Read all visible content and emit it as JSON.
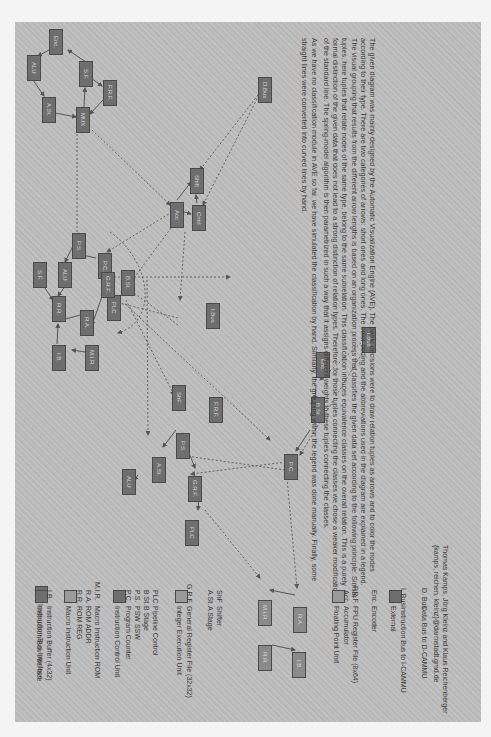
{
  "colors": {
    "page_bg": "#bdbdbd",
    "node_fill": "#6e6e6e",
    "node_border": "#4a4a4a",
    "text": "#3a3a3a",
    "edge": "#555555"
  },
  "description": {
    "paragraphs": [
      "The given diagram was mainly designed by the Automatic Visualization Engine (AVE). The basic decisions were to draw relation tuples as arrows and to color the nodes according to their type. There are two categories of arrows: short ones and long ones. The color coding and the abbreviations used in the diagram are explained in a legend. The visual grouping that results from the different arrow lengths is based on an organization process that classifies the given data set according to the following principle: Similar tuples, here tuples that relate nodes of the same type, belong to the same subrelation. This classification induces equivalence classes on the overall relation. This is a purely formal distinction of the given data that does not lead to a strong distinction of relation types. Therefore, for those tuples connecting the classes we chose a weaker modification of the standard line. The spring-model algorithm is then parametrized in such a way that it assigns different weights to these tuples connecting the classes.",
      "As we have no classification module in AVE so far, we have simulated the classification by hand. Similarly, the grouping within the legend was done manually. Finally, some straight lines were converted into curved lines by hand."
    ]
  },
  "credits": {
    "authors": "Thomas Kamps, Jörg Kleinz and Klaus Reichenberger",
    "emails": "{kamps, reichen, kleinz}@darmstadt.gmd.de"
  },
  "legend": {
    "groups": [
      {
        "swatch": "dark",
        "title": "Instruction Bus Interface",
        "items": [
          {
            "abbr": "I.B.",
            "label": "Instruction Buffer (4x32)"
          }
        ]
      },
      {
        "swatch": "light",
        "title": "Macro Instruction Unit",
        "items": [
          {
            "abbr": "R.R.",
            "label": "ROM REG"
          },
          {
            "abbr": "R.A.",
            "label": "ROM ADDR"
          },
          {
            "abbr": "M.I.R.",
            "label": "Macro Instruction ROM"
          }
        ]
      },
      {
        "swatch": "dark",
        "title": "Instruction Control Unit",
        "items": [
          {
            "abbr": "P.C.",
            "label": "Program Counter"
          },
          {
            "abbr": "P.S.",
            "label": "PSW SSW"
          },
          {
            "abbr": "B.St.",
            "label": "B Stage"
          },
          {
            "abbr": "PLC.",
            "label": "Pipeline Control"
          }
        ]
      },
      {
        "swatch": "light",
        "title": "Integer Execution Unit",
        "items": [
          {
            "abbr": "G.R.F.",
            "label": "General Register File (32x32)"
          },
          {
            "abbr": "A.St.",
            "label": "A Stage"
          },
          {
            "abbr": "ShF",
            "label": "Shifter"
          }
        ]
      },
      {
        "swatch": "light",
        "title": "Floating Point Unit",
        "items": [
          {
            "abbr": "Acc",
            "label": "Accumulator"
          },
          {
            "abbr": "F.R.F.",
            "label": "FPU Register File (8x64)"
          },
          {
            "abbr": "Enc.",
            "label": "Encoder"
          }
        ]
      },
      {
        "swatch": "dark",
        "title": "External",
        "items": [
          {
            "abbr": "I. Bus",
            "label": "Instruction Bus to I-CAMMU"
          },
          {
            "abbr": "D. Bus",
            "label": "Data Bus to D-CAMMU"
          }
        ]
      }
    ]
  },
  "diagram": {
    "nodes": [
      {
        "id": "n1",
        "label": "Enc.",
        "x": 56,
        "y": 29
      },
      {
        "id": "n2",
        "label": "ALU",
        "x": 27,
        "y": 55
      },
      {
        "id": "n3",
        "label": "A.St.",
        "x": 43,
        "y": 97
      },
      {
        "id": "n4",
        "label": "MUX",
        "x": 77,
        "y": 107
      },
      {
        "id": "n5",
        "label": "S.F.",
        "x": 79,
        "y": 61
      },
      {
        "id": "n6",
        "label": "F.R.F.",
        "x": 102,
        "y": 80
      },
      {
        "id": "n7",
        "label": "D.Bus",
        "x": 259,
        "y": 77
      },
      {
        "id": "n8",
        "label": "Acc",
        "x": 170,
        "y": 202
      },
      {
        "id": "n9",
        "label": "Shift",
        "x": 189,
        "y": 168
      },
      {
        "id": "n10",
        "label": "Cntrl",
        "x": 191,
        "y": 205
      },
      {
        "id": "n11",
        "label": "P.S.",
        "x": 72,
        "y": 242
      },
      {
        "id": "n12",
        "label": "ALU",
        "x": 59,
        "y": 262
      },
      {
        "id": "n13",
        "label": "P.C.",
        "x": 98,
        "y": 253
      },
      {
        "id": "n14",
        "label": "B.St.",
        "x": 121,
        "y": 270
      },
      {
        "id": "n15",
        "label": "S.F.",
        "x": 35,
        "y": 272
      },
      {
        "id": "n16",
        "label": "R.R.",
        "x": 52,
        "y": 296
      },
      {
        "id": "n17",
        "label": "PLC",
        "x": 116,
        "y": 283
      },
      {
        "id": "n18",
        "label": "I.B.",
        "x": 55,
        "y": 344
      },
      {
        "id": "n19",
        "label": "R.A.",
        "x": 75,
        "y": 312
      },
      {
        "id": "n20",
        "label": "M.I.R.",
        "x": 84,
        "y": 352
      },
      {
        "id": "n21",
        "label": "G.R.F.",
        "x": 108,
        "y": 279
      },
      {
        "id": "n22",
        "label": "I.Bus",
        "x": 178,
        "y": 300
      },
      {
        "id": "n23",
        "label": "ShF",
        "x": 175,
        "y": 395
      },
      {
        "id": "n24",
        "label": "P.S.",
        "x": 174,
        "y": 407
      },
      {
        "id": "n25",
        "label": "A.St.",
        "x": 153,
        "y": 436
      },
      {
        "id": "n26",
        "label": "ALU",
        "x": 127,
        "y": 460
      },
      {
        "id": "n27",
        "label": "G.R.F.",
        "x": 124,
        "y": 465
      },
      {
        "id": "n28",
        "label": "PLC",
        "x": 190,
        "y": 469
      },
      {
        "id": "n29",
        "label": "F.R.F.",
        "x": 198,
        "y": 511
      },
      {
        "id": "n30",
        "label": "P.C.",
        "x": 286,
        "y": 451
      },
      {
        "id": "n31",
        "label": "B.St.",
        "x": 312,
        "y": 405
      },
      {
        "id": "n32",
        "label": "Enc.",
        "x": 319,
        "y": 362
      },
      {
        "id": "n33",
        "label": "I.Bus",
        "x": 364,
        "y": 334
      },
      {
        "id": "n34",
        "label": "M.I.R.",
        "x": 257,
        "y": 580
      },
      {
        "id": "n35",
        "label": "R.A.",
        "x": 298,
        "y": 589
      },
      {
        "id": "n36",
        "label": "R.R.",
        "x": 264,
        "y": 635
      },
      {
        "id": "n37",
        "label": "I.B.",
        "x": 295,
        "y": 634
      }
    ]
  }
}
